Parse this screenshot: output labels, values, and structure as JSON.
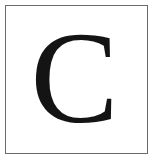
{
  "tile": {
    "letter": "C",
    "border_color": "#6a6a6a",
    "letter_color": "#141414",
    "background": "#ffffff"
  }
}
